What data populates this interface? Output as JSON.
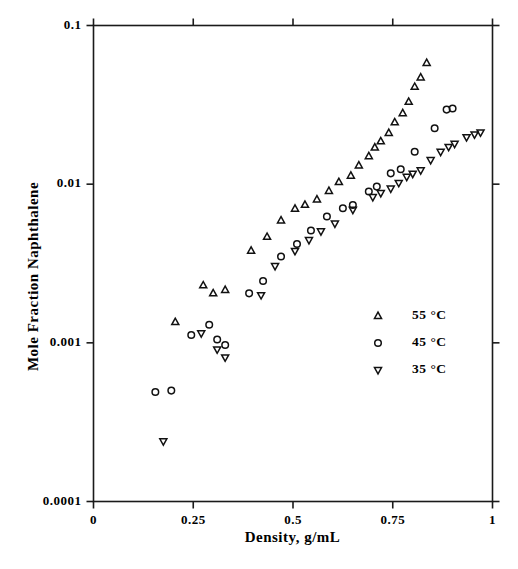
{
  "chart_data": {
    "type": "scatter",
    "title": "",
    "xlabel": "Density,  g/mL",
    "ylabel": "Mole Fraction Naphthalene",
    "xlim": [
      0,
      1
    ],
    "ylim": [
      0.0001,
      0.1
    ],
    "yscale": "log",
    "xscale": "linear",
    "grid": false,
    "legend_position": "lower right",
    "xticks": [
      "0",
      "0.25",
      "0.5",
      "0.75",
      "1"
    ],
    "xtick_values": [
      0,
      0.25,
      0.5,
      0.75,
      1
    ],
    "yticks": [
      "0.0001",
      "0.001",
      "0.01",
      "0.1"
    ],
    "ytick_values": [
      0.0001,
      0.001,
      0.01,
      0.1
    ],
    "series": [
      {
        "name": "55 °C",
        "marker": "triangle-up",
        "color": "#000000",
        "points": [
          [
            0.205,
            0.00135
          ],
          [
            0.275,
            0.0023
          ],
          [
            0.3,
            0.00205
          ],
          [
            0.33,
            0.00215
          ],
          [
            0.395,
            0.0038
          ],
          [
            0.435,
            0.00465
          ],
          [
            0.47,
            0.0059
          ],
          [
            0.505,
            0.007
          ],
          [
            0.53,
            0.0074
          ],
          [
            0.56,
            0.008
          ],
          [
            0.59,
            0.00905
          ],
          [
            0.615,
            0.0103
          ],
          [
            0.645,
            0.0113
          ],
          [
            0.665,
            0.0131
          ],
          [
            0.69,
            0.015
          ],
          [
            0.705,
            0.017
          ],
          [
            0.72,
            0.0186
          ],
          [
            0.74,
            0.021
          ],
          [
            0.755,
            0.0245
          ],
          [
            0.775,
            0.028
          ],
          [
            0.79,
            0.033
          ],
          [
            0.805,
            0.041
          ],
          [
            0.82,
            0.047
          ],
          [
            0.835,
            0.058
          ]
        ]
      },
      {
        "name": "45 °C",
        "marker": "circle",
        "color": "#000000",
        "points": [
          [
            0.155,
            0.00049
          ],
          [
            0.195,
            0.0005
          ],
          [
            0.245,
            0.00112
          ],
          [
            0.29,
            0.0013
          ],
          [
            0.31,
            0.00105
          ],
          [
            0.33,
            0.00097
          ],
          [
            0.39,
            0.00205
          ],
          [
            0.425,
            0.00245
          ],
          [
            0.47,
            0.0035
          ],
          [
            0.51,
            0.0042
          ],
          [
            0.545,
            0.0051
          ],
          [
            0.585,
            0.00625
          ],
          [
            0.625,
            0.00705
          ],
          [
            0.65,
            0.0074
          ],
          [
            0.69,
            0.009
          ],
          [
            0.71,
            0.00965
          ],
          [
            0.745,
            0.0117
          ],
          [
            0.77,
            0.0124
          ],
          [
            0.805,
            0.016
          ],
          [
            0.855,
            0.0225
          ],
          [
            0.885,
            0.0295
          ],
          [
            0.9,
            0.03
          ]
        ]
      },
      {
        "name": "35 °C",
        "marker": "triangle-down",
        "color": "#000000",
        "points": [
          [
            0.175,
            0.00024
          ],
          [
            0.27,
            0.00115
          ],
          [
            0.31,
            0.00091
          ],
          [
            0.33,
            0.00081
          ],
          [
            0.42,
            0.002
          ],
          [
            0.455,
            0.00305
          ],
          [
            0.505,
            0.0038
          ],
          [
            0.54,
            0.00445
          ],
          [
            0.57,
            0.00505
          ],
          [
            0.605,
            0.00565
          ],
          [
            0.65,
            0.0069
          ],
          [
            0.7,
            0.0083
          ],
          [
            0.72,
            0.0088
          ],
          [
            0.745,
            0.0094
          ],
          [
            0.765,
            0.0102
          ],
          [
            0.785,
            0.01115
          ],
          [
            0.8,
            0.01165
          ],
          [
            0.82,
            0.01225
          ],
          [
            0.845,
            0.0142
          ],
          [
            0.87,
            0.016
          ],
          [
            0.89,
            0.0172
          ],
          [
            0.905,
            0.018
          ],
          [
            0.935,
            0.0198
          ],
          [
            0.955,
            0.0206
          ],
          [
            0.97,
            0.0212
          ]
        ]
      }
    ],
    "legend": [
      {
        "label": "55 °C",
        "marker": "triangle-up"
      },
      {
        "label": "45 °C",
        "marker": "circle"
      },
      {
        "label": "35 °C",
        "marker": "triangle-down"
      }
    ]
  }
}
